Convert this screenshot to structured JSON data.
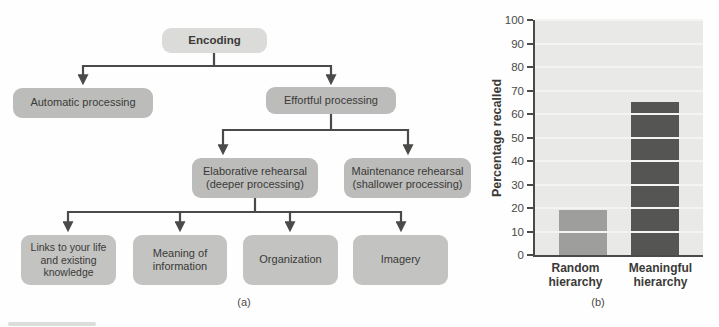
{
  "figure": {
    "panel_captions": {
      "a": "(a)",
      "b": "(b)"
    }
  },
  "flowchart": {
    "nodes": {
      "encoding": {
        "label": "Encoding"
      },
      "automatic_processing": {
        "label": "Automatic processing"
      },
      "effortful_processing": {
        "label": "Effortful processing"
      },
      "elaborative_rehearsal": {
        "label": "Elaborative rehearsal",
        "sublabel": "(deeper processing)"
      },
      "maintenance_rehearsal": {
        "label": "Maintenance rehearsal",
        "sublabel": "(shallower processing)"
      },
      "links": {
        "label": "Links to your life and existing knowledge"
      },
      "meaning": {
        "label": "Meaning of information"
      },
      "organization": {
        "label": "Organization"
      },
      "imagery": {
        "label": "Imagery"
      }
    },
    "colors": {
      "node_fill": "#bcbcba",
      "root_fill": "#dbdbd9",
      "leaf_fill": "#c3c3c1",
      "connector": "#4a4a48",
      "text": "#3a3a38"
    }
  },
  "chart_data": {
    "type": "bar",
    "title": "",
    "xlabel": "",
    "ylabel": "Percentage recalled",
    "categories": [
      "Random hierarchy",
      "Meaningful hierarchy"
    ],
    "values": [
      19,
      65
    ],
    "ylim": [
      0,
      100
    ],
    "yticks": [
      0,
      10,
      20,
      30,
      40,
      50,
      60,
      70,
      80,
      90,
      100
    ],
    "grid": true,
    "legend": false,
    "bar_colors": [
      "#9e9e9c",
      "#555553"
    ],
    "plot_bg": "#e9e9e7",
    "gridline_color": "#f4f4f2",
    "axis_color": "#4a4a48"
  }
}
